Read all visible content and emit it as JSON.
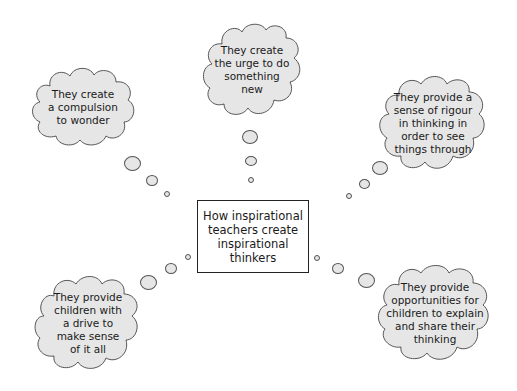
{
  "diagram": {
    "type": "mind-map",
    "central_topic": "How inspirational\nteachers create\ninspirational\nthinkers",
    "thoughts": [
      {
        "id": "top-left",
        "text": "They create\na compulsion\nto wonder"
      },
      {
        "id": "top-center",
        "text": "They create\nthe urge to do\nsomething\nnew"
      },
      {
        "id": "top-right",
        "text": "They provide a\nsense of rigour\nin thinking in\norder to see\nthings through"
      },
      {
        "id": "bottom-left",
        "text": "They provide\nchildren with\na drive to\nmake sense\nof it all"
      },
      {
        "id": "bottom-right",
        "text": "They provide\nopportunities for\nchildren to explain\nand share their\nthinking"
      }
    ],
    "colors": {
      "cloud_fill": "#e6e6e6",
      "cloud_stroke": "#555555",
      "box_border": "#222222",
      "text": "#1a1a1a",
      "background": "#ffffff"
    }
  }
}
